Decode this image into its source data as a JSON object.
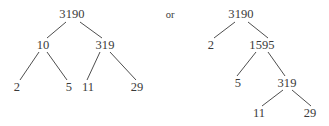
{
  "figure": {
    "background_color": "#ffffff",
    "ink_color": "#3a3a3a",
    "width": 329,
    "height": 126
  },
  "connector": {
    "label": "or",
    "x": 170,
    "y": 14
  },
  "trees": [
    {
      "name": "left-factor-tree",
      "root_value": "3190",
      "nodes": [
        {
          "id": "L-root",
          "label": "3190",
          "x": 72,
          "y": 14
        },
        {
          "id": "L-10",
          "label": "10",
          "x": 43,
          "y": 45
        },
        {
          "id": "L-319",
          "label": "319",
          "x": 105,
          "y": 45
        },
        {
          "id": "L-2",
          "label": "2",
          "x": 17,
          "y": 87
        },
        {
          "id": "L-5",
          "label": "5",
          "x": 69,
          "y": 87
        },
        {
          "id": "L-11",
          "label": "11",
          "x": 88,
          "y": 87
        },
        {
          "id": "L-29",
          "label": "29",
          "x": 137,
          "y": 87
        }
      ],
      "edges": [
        {
          "from": "L-root",
          "to": "L-10",
          "x1": 66,
          "y1": 22,
          "x2": 47,
          "y2": 38
        },
        {
          "from": "L-root",
          "to": "L-319",
          "x1": 80,
          "y1": 22,
          "x2": 102,
          "y2": 38
        },
        {
          "from": "L-10",
          "to": "L-2",
          "x1": 39,
          "y1": 52,
          "x2": 20,
          "y2": 80
        },
        {
          "from": "L-10",
          "to": "L-5",
          "x1": 47,
          "y1": 52,
          "x2": 67,
          "y2": 80
        },
        {
          "from": "L-319",
          "to": "L-11",
          "x1": 100,
          "y1": 52,
          "x2": 87,
          "y2": 80
        },
        {
          "from": "L-319",
          "to": "L-29",
          "x1": 110,
          "y1": 52,
          "x2": 136,
          "y2": 80
        }
      ]
    },
    {
      "name": "right-factor-tree",
      "root_value": "3190",
      "nodes": [
        {
          "id": "R-root",
          "label": "3190",
          "x": 241,
          "y": 14
        },
        {
          "id": "R-2",
          "label": "2",
          "x": 211,
          "y": 45
        },
        {
          "id": "R-1595",
          "label": "1595",
          "x": 262,
          "y": 45
        },
        {
          "id": "R-5",
          "label": "5",
          "x": 238,
          "y": 83
        },
        {
          "id": "R-319",
          "label": "319",
          "x": 287,
          "y": 83
        },
        {
          "id": "R-11",
          "label": "11",
          "x": 259,
          "y": 113
        },
        {
          "id": "R-29",
          "label": "29",
          "x": 310,
          "y": 113
        }
      ],
      "edges": [
        {
          "from": "R-root",
          "to": "R-2",
          "x1": 235,
          "y1": 22,
          "x2": 214,
          "y2": 38
        },
        {
          "from": "R-root",
          "to": "R-1595",
          "x1": 248,
          "y1": 22,
          "x2": 268,
          "y2": 38
        },
        {
          "from": "R-1595",
          "to": "R-5",
          "x1": 256,
          "y1": 52,
          "x2": 237,
          "y2": 76
        },
        {
          "from": "R-1595",
          "to": "R-319",
          "x1": 268,
          "y1": 52,
          "x2": 285,
          "y2": 76
        },
        {
          "from": "R-319",
          "to": "R-11",
          "x1": 283,
          "y1": 90,
          "x2": 262,
          "y2": 106
        },
        {
          "from": "R-319",
          "to": "R-29",
          "x1": 292,
          "y1": 90,
          "x2": 311,
          "y2": 106
        }
      ]
    }
  ]
}
